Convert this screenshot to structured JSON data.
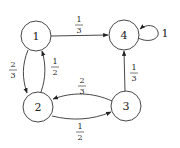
{
  "diagram": {
    "type": "markov-chain-state-diagram",
    "nodes": [
      {
        "id": "1",
        "label": "1"
      },
      {
        "id": "2",
        "label": "2"
      },
      {
        "id": "3",
        "label": "3"
      },
      {
        "id": "4",
        "label": "4"
      }
    ],
    "edges": [
      {
        "from": "1",
        "to": "4",
        "num": "1",
        "den": "3"
      },
      {
        "from": "1",
        "to": "2",
        "num": "2",
        "den": "3"
      },
      {
        "from": "2",
        "to": "1",
        "num": "1",
        "den": "2"
      },
      {
        "from": "3",
        "to": "2",
        "num": "2",
        "den": "3"
      },
      {
        "from": "2",
        "to": "3",
        "num": "1",
        "den": "2"
      },
      {
        "from": "3",
        "to": "4",
        "num": "1",
        "den": "3"
      },
      {
        "from": "4",
        "to": "4",
        "label": "1"
      }
    ]
  }
}
